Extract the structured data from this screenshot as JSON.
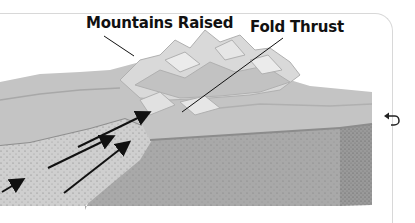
{
  "diagram": {
    "labels": {
      "mountains_raised": "Mountains Raised",
      "fold_thrust": "Fold Thrust"
    },
    "arrows": [
      {
        "direction": "up-right",
        "from": [
          44,
          170
        ],
        "to": [
          115,
          135
        ]
      },
      {
        "direction": "up-right",
        "from": [
          76,
          170
        ],
        "to": [
          150,
          140
        ]
      },
      {
        "direction": "up-right",
        "from": [
          64,
          193
        ],
        "to": [
          130,
          141
        ]
      },
      {
        "direction": "up-right",
        "from": [
          2,
          190
        ],
        "to": [
          27,
          175
        ]
      }
    ],
    "colors": {
      "mountain_light": "#d6d6d6",
      "mountain_mid": "#b8b8b8",
      "surface": "#c4c4c4",
      "plate_left": "#c9c9c9",
      "plate_right": "#a9a9a9",
      "plate_edge": "#8f8f8f",
      "ink": "#111111"
    }
  },
  "controls": {
    "back_icon": "undo-arrow-icon"
  }
}
